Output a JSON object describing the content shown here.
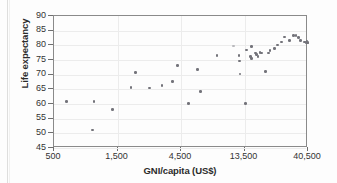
{
  "figure": {
    "background_color": "#fdfdfd",
    "frame_color": "#8a8a8a",
    "grid_color": "#ececec",
    "point_color": "#73737a"
  },
  "chart_data": {
    "type": "scatter",
    "title": "",
    "xlabel": "GNI/capita (US$)",
    "ylabel": "Life expectancy",
    "xscale": "log",
    "xlim": [
      500,
      40500
    ],
    "ylim": [
      45,
      90
    ],
    "xticks": [
      500,
      1500,
      4500,
      13500,
      40500
    ],
    "xtick_labels": [
      "500",
      "1,500",
      "4,500",
      "13,500",
      "40,500"
    ],
    "yticks": [
      45,
      50,
      55,
      60,
      65,
      70,
      75,
      80,
      85,
      90
    ],
    "ytick_labels": [
      "45",
      "50",
      "55",
      "60",
      "65",
      "70",
      "75",
      "80",
      "85",
      "90"
    ],
    "grid": true,
    "legend": null,
    "marker": "circle",
    "point_count": 45,
    "points": [
      {
        "x": 620,
        "y": 60.8
      },
      {
        "x": 1000,
        "y": 60.9
      },
      {
        "x": 970,
        "y": 51.1
      },
      {
        "x": 1380,
        "y": 58.1
      },
      {
        "x": 1900,
        "y": 65.7
      },
      {
        "x": 2050,
        "y": 70.7
      },
      {
        "x": 2600,
        "y": 65.4
      },
      {
        "x": 3250,
        "y": 66.3
      },
      {
        "x": 3900,
        "y": 67.6
      },
      {
        "x": 4250,
        "y": 73.2
      },
      {
        "x": 5100,
        "y": 60.1
      },
      {
        "x": 6000,
        "y": 71.7
      },
      {
        "x": 6300,
        "y": 64.3
      },
      {
        "x": 8400,
        "y": 76.5
      },
      {
        "x": 11200,
        "y": 79.8,
        "faint": true
      },
      {
        "x": 12300,
        "y": 76.6
      },
      {
        "x": 12400,
        "y": 74.6
      },
      {
        "x": 12500,
        "y": 70.2
      },
      {
        "x": 13700,
        "y": 60.1
      },
      {
        "x": 14000,
        "y": 78.4
      },
      {
        "x": 15200,
        "y": 79.7
      },
      {
        "x": 15000,
        "y": 76.1
      },
      {
        "x": 15300,
        "y": 75.6
      },
      {
        "x": 16400,
        "y": 77.4
      },
      {
        "x": 16700,
        "y": 76.8
      },
      {
        "x": 17000,
        "y": 76.2
      },
      {
        "x": 17600,
        "y": 77.5
      },
      {
        "x": 18200,
        "y": 77.4
      },
      {
        "x": 19400,
        "y": 71.1
      },
      {
        "x": 20500,
        "y": 77.4
      },
      {
        "x": 21000,
        "y": 78.2
      },
      {
        "x": 22800,
        "y": 78.9
      },
      {
        "x": 24000,
        "y": 80.1
      },
      {
        "x": 25500,
        "y": 81.2
      },
      {
        "x": 27000,
        "y": 82.9
      },
      {
        "x": 29500,
        "y": 81.7
      },
      {
        "x": 31500,
        "y": 83.3
      },
      {
        "x": 33000,
        "y": 83.3
      },
      {
        "x": 34500,
        "y": 82.7
      },
      {
        "x": 35500,
        "y": 81.6
      },
      {
        "x": 38000,
        "y": 81.2
      },
      {
        "x": 39000,
        "y": 80.9
      },
      {
        "x": 39800,
        "y": 81.3
      },
      {
        "x": 40200,
        "y": 81.0
      },
      {
        "x": 40450,
        "y": 80.8
      }
    ]
  }
}
